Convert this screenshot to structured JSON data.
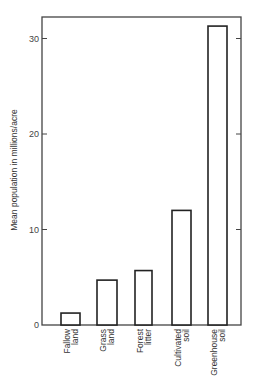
{
  "chart_data": {
    "type": "bar",
    "title": "",
    "xlabel": "",
    "ylabel": "Mean population in millions/acre",
    "categories": [
      [
        "Fallow",
        "land"
      ],
      [
        "Grass",
        "land"
      ],
      [
        "Forest",
        "litter"
      ],
      [
        "Cultivated",
        "soil"
      ],
      [
        "Greenhouse",
        "soil"
      ]
    ],
    "category_names": [
      "Fallow land",
      "Grass land",
      "Forest litter",
      "Cultivated soil",
      "Greenhouse soil"
    ],
    "values": [
      1.25,
      4.7,
      5.7,
      12.0,
      31.3
    ],
    "ylim": [
      0,
      32.5
    ],
    "yticks": [
      0,
      10,
      20,
      30
    ],
    "ytick_labels": [
      "0",
      "10",
      "20",
      "30"
    ],
    "grid": false,
    "legend": null,
    "bar_fill": "#ffffff",
    "bar_stroke": "#222222"
  }
}
